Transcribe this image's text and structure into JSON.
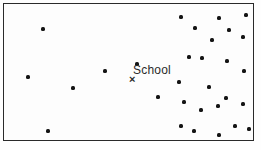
{
  "colors": {
    "dot": "#141414",
    "frame_border": "#2a2a2a",
    "background": "#fdfdfd",
    "text": "#2b2b2b"
  },
  "chart_data": {
    "type": "scatter",
    "title": "",
    "xlabel": "",
    "ylabel": "",
    "axes_visible": false,
    "grid": false,
    "frame": "rectangular border",
    "pixel_extent": {
      "x_range": [
        3,
        256
      ],
      "y_range": [
        3,
        143
      ]
    },
    "annotation": {
      "label": "School",
      "marker_glyph": "×",
      "marker_px": {
        "x": 134,
        "y": 81
      },
      "label_px": {
        "x": 135,
        "y": 66
      }
    },
    "points": [
      [
        43,
        29
      ],
      [
        105,
        71
      ],
      [
        28,
        77
      ],
      [
        73,
        88
      ],
      [
        48,
        131
      ],
      [
        137,
        64
      ],
      [
        181,
        17
      ],
      [
        219,
        18
      ],
      [
        246,
        15
      ],
      [
        195,
        28
      ],
      [
        229,
        30
      ],
      [
        212,
        40
      ],
      [
        243,
        37
      ],
      [
        189,
        57
      ],
      [
        202,
        58
      ],
      [
        227,
        61
      ],
      [
        244,
        71
      ],
      [
        179,
        82
      ],
      [
        209,
        87
      ],
      [
        158,
        97
      ],
      [
        184,
        102
      ],
      [
        226,
        98
      ],
      [
        243,
        104
      ],
      [
        218,
        106
      ],
      [
        201,
        110
      ],
      [
        181,
        126
      ],
      [
        235,
        126
      ],
      [
        249,
        129
      ],
      [
        194,
        131
      ],
      [
        219,
        135
      ]
    ]
  }
}
